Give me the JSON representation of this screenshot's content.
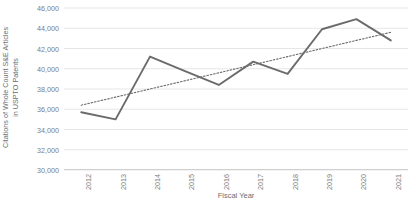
{
  "chart_data": {
    "type": "line",
    "title": "",
    "xlabel": "Fiscal Year",
    "ylabel": "Citations of Whole Count S&E Articles in USPTO Patents",
    "ylabel_line1": "Citations of Whole Count S&E Articles",
    "ylabel_line2": "in USPTO Patents",
    "categories": [
      "2012",
      "2013",
      "2014",
      "2015",
      "2016",
      "2017",
      "2018",
      "2019",
      "2020",
      "2021"
    ],
    "x": [
      2012,
      2013,
      2014,
      2015,
      2016,
      2017,
      2018,
      2019,
      2020,
      2021
    ],
    "ylim": [
      30000,
      46000
    ],
    "ytick_values": [
      30000,
      32000,
      34000,
      36000,
      38000,
      40000,
      42000,
      44000,
      46000
    ],
    "ytick_labels": [
      "30,000",
      "32,000",
      "34,000",
      "36,000",
      "38,000",
      "40,000",
      "42,000",
      "44,000",
      "46,000"
    ],
    "grid": true,
    "legend": "none",
    "series": [
      {
        "name": "Citations of Whole Count S&E Articles in USPTO Patents",
        "style": "solid",
        "color": "#6b6b6b",
        "values": [
          35700,
          35000,
          41200,
          39800,
          38400,
          40700,
          39500,
          43900,
          44900,
          42800
        ]
      },
      {
        "name": "Linear trendline",
        "style": "dotted",
        "color": "#6b6b6b",
        "values": [
          36400,
          37200,
          38000,
          38800,
          39600,
          40400,
          41200,
          42000,
          42800,
          43600
        ]
      }
    ],
    "colors": {
      "line": "#6b6b6b",
      "trendline": "#6b6b6b",
      "gridline": "#e6e6e6",
      "axis": "#d0d0d0",
      "tick_text": "#7d7d7d",
      "title_text": "#6e6e6e",
      "background": "#ffffff"
    }
  }
}
